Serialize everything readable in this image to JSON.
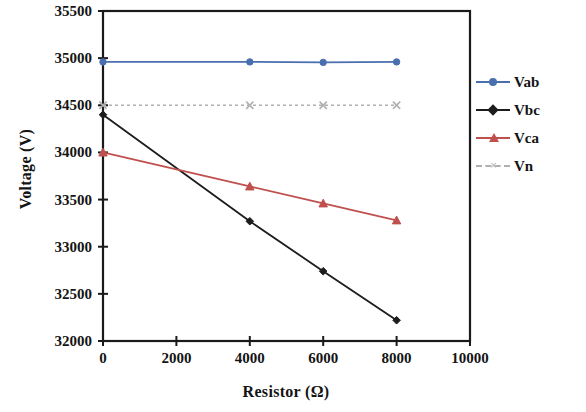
{
  "chart_data": {
    "type": "line",
    "title": "",
    "xlabel": "Resistor (Ω)",
    "ylabel": "Voltage (V)",
    "xlim": [
      0,
      10000
    ],
    "ylim": [
      32000,
      35500
    ],
    "xticks": [
      0,
      2000,
      4000,
      6000,
      8000,
      10000
    ],
    "xtick_labels": [
      "0",
      "2000",
      "4000",
      "6000",
      "8000",
      "10000"
    ],
    "yticks": [
      32000,
      32500,
      33000,
      33500,
      34000,
      34500,
      35000,
      35500
    ],
    "ytick_labels": [
      "32000",
      "32500",
      "33000",
      "33500",
      "34000",
      "34500",
      "35000",
      "35500"
    ],
    "grid": false,
    "legend_position": "right",
    "x": [
      0,
      4000,
      6000,
      8000
    ],
    "series": [
      {
        "name": "Vab",
        "color": "#4a6fae",
        "marker": "circle",
        "linestyle": "solid",
        "values": [
          34960,
          34960,
          34955,
          34960
        ]
      },
      {
        "name": "Vbc",
        "color": "#1c1c1c",
        "marker": "diamond",
        "linestyle": "solid",
        "values": [
          34400,
          33270,
          32740,
          32220
        ]
      },
      {
        "name": "Vca",
        "color": "#c0504d",
        "marker": "triangle",
        "linestyle": "solid",
        "values": [
          34000,
          33640,
          33460,
          33280
        ]
      },
      {
        "name": "Vn",
        "color": "#b0b0b0",
        "marker": "x",
        "linestyle": "dashed",
        "values": [
          34500,
          34500,
          34500,
          34500
        ]
      }
    ]
  },
  "legend": {
    "items": [
      {
        "label": "Vab",
        "color": "#4a6fae",
        "marker": "circle",
        "linestyle": "solid"
      },
      {
        "label": "Vbc",
        "color": "#1c1c1c",
        "marker": "diamond",
        "linestyle": "solid"
      },
      {
        "label": "Vca",
        "color": "#c0504d",
        "marker": "triangle",
        "linestyle": "solid"
      },
      {
        "label": "Vn",
        "color": "#b0b0b0",
        "marker": "x",
        "linestyle": "dashed"
      }
    ]
  },
  "axes": {
    "frame_color": "#1a1a1a"
  }
}
